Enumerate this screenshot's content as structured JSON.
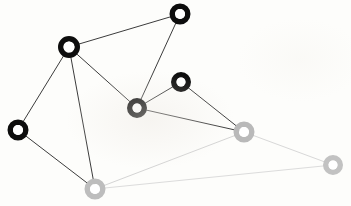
{
  "figure": {
    "background_color": "#fdfdfb",
    "width": 351,
    "height": 206
  },
  "legend": {
    "dark_group_label": "dark-cluster",
    "light_group_label": "light-cluster"
  },
  "chart_data": {
    "type": "scatter",
    "subtitle": "",
    "xlabel": "",
    "ylabel": "",
    "grid": false,
    "legend_position": "none",
    "xlim": [
      0,
      351
    ],
    "ylim": [
      0,
      206
    ],
    "colors": {
      "dark_node": "#0d0d0d",
      "dark_node_hole": "#ffffff",
      "light_node": "#b9b9b9",
      "light_node_hole": "#ffffff",
      "dark_edge": "#3c3c3c",
      "light_edge": "#d4d4d4",
      "background": "#fdfdfb"
    },
    "node_style": {
      "outer_radius": 10,
      "inner_radius": 4.5,
      "ring_width": 5.5
    },
    "nodes": [
      {
        "id": "n1",
        "label": "top",
        "x": 180,
        "y": 14,
        "group": "dark",
        "color": "#0d0d0d",
        "radius": 10.5
      },
      {
        "id": "n2",
        "label": "upper-left",
        "x": 69,
        "y": 47,
        "group": "dark",
        "color": "#0d0d0d",
        "radius": 11
      },
      {
        "id": "n3",
        "label": "mid-right",
        "x": 181,
        "y": 82,
        "group": "dark",
        "color": "#0d0d0d",
        "radius": 10
      },
      {
        "id": "n4",
        "label": "center",
        "x": 137,
        "y": 108,
        "group": "dark",
        "color": "#0d0d0d",
        "radius": 10
      },
      {
        "id": "n5",
        "label": "left",
        "x": 18,
        "y": 130,
        "group": "dark",
        "color": "#0d0d0d",
        "radius": 10.5
      },
      {
        "id": "n6",
        "label": "right-gray",
        "x": 244,
        "y": 132,
        "group": "light",
        "color": "#b9b9b9",
        "radius": 10.5
      },
      {
        "id": "n7",
        "label": "far-right-gray",
        "x": 333,
        "y": 165,
        "group": "light",
        "color": "#c2c2c2",
        "radius": 10
      },
      {
        "id": "n8",
        "label": "bottom-gray",
        "x": 95,
        "y": 189,
        "group": "light",
        "color": "#bdbdbd",
        "radius": 10.5
      }
    ],
    "edges": [
      {
        "source": "n2",
        "target": "n1",
        "group": "dark",
        "color": "#3c3c3c",
        "width": 1
      },
      {
        "source": "n1",
        "target": "n4",
        "group": "dark",
        "color": "#3c3c3c",
        "width": 1
      },
      {
        "source": "n2",
        "target": "n4",
        "group": "dark",
        "color": "#3c3c3c",
        "width": 1
      },
      {
        "source": "n2",
        "target": "n5",
        "group": "dark",
        "color": "#3c3c3c",
        "width": 1
      },
      {
        "source": "n2",
        "target": "n8",
        "group": "dark",
        "color": "#3c3c3c",
        "width": 1
      },
      {
        "source": "n5",
        "target": "n8",
        "group": "dark",
        "color": "#3c3c3c",
        "width": 1
      },
      {
        "source": "n4",
        "target": "n3",
        "group": "dark",
        "color": "#3c3c3c",
        "width": 1
      },
      {
        "source": "n4",
        "target": "n6",
        "group": "dark",
        "color": "#3c3c3c",
        "width": 1
      },
      {
        "source": "n3",
        "target": "n6",
        "group": "dark",
        "color": "#3c3c3c",
        "width": 1
      },
      {
        "source": "n6",
        "target": "n8",
        "group": "light",
        "color": "#d4d4d4",
        "width": 1
      },
      {
        "source": "n6",
        "target": "n7",
        "group": "light",
        "color": "#d8d8d8",
        "width": 1
      },
      {
        "source": "n7",
        "target": "n8",
        "group": "light",
        "color": "#dcdcdc",
        "width": 1
      }
    ]
  }
}
